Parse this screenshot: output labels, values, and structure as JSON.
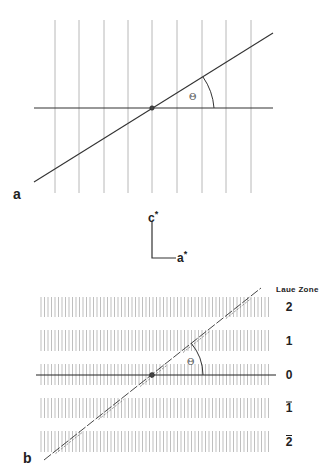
{
  "figure": {
    "panel_a": {
      "label": "a",
      "angle_label": "Θ",
      "vertical_lines_x": [
        55,
        79,
        104,
        128,
        152,
        177,
        202,
        226,
        251
      ],
      "vertical_line_y_range": [
        20,
        193
      ],
      "horizontal_axis": {
        "x1": 34,
        "x2": 273,
        "y": 108
      },
      "diagonal": {
        "x1": 34,
        "y1": 182,
        "x2": 273,
        "y2": 33
      },
      "origin": {
        "x": 152,
        "y": 108
      }
    },
    "axes_key": {
      "vertical_label": "c",
      "vertical_star": "*",
      "horizontal_label": "a",
      "horizontal_star": "*"
    },
    "panel_b": {
      "label": "b",
      "angle_label": "Θ",
      "legend_title": "Laue Zone",
      "zones": [
        {
          "label": "2",
          "bar": false,
          "y_top": 297,
          "y_bot": 317
        },
        {
          "label": "1",
          "bar": false,
          "y_top": 330,
          "y_bot": 351
        },
        {
          "label": "0",
          "bar": false,
          "y_top": 364,
          "y_bot": 385
        },
        {
          "label": "1",
          "bar": true,
          "y_top": 398,
          "y_bot": 418
        },
        {
          "label": "2",
          "bar": true,
          "y_top": 431,
          "y_bot": 452
        }
      ],
      "band_x_range": [
        41,
        270
      ],
      "band_line_spacing": 3.5,
      "horizontal_axis": {
        "x1": 36,
        "x2": 276,
        "y": 375
      },
      "diagonal": {
        "x1": 44,
        "y1": 460,
        "x2": 261,
        "y2": 288
      },
      "origin": {
        "x": 152,
        "y": 375
      }
    },
    "colors": {
      "grid_line": "#b8b8b8",
      "axis_line": "#333333",
      "text": "#222222"
    }
  }
}
